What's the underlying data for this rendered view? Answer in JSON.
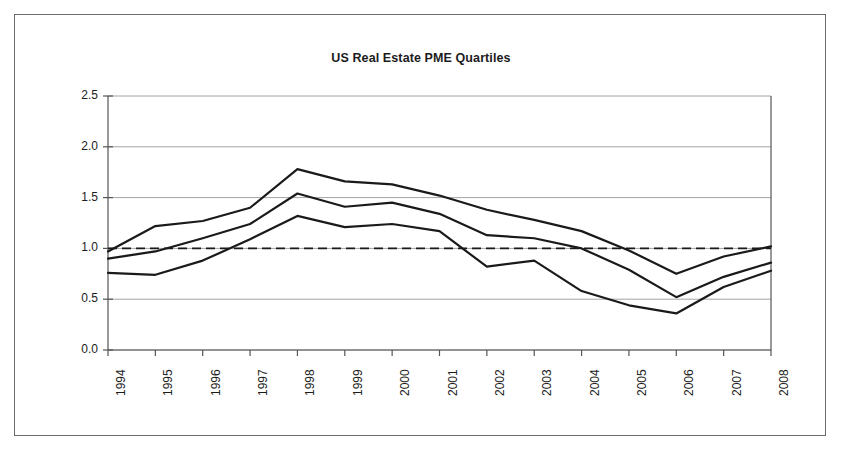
{
  "figure": {
    "title": "US Real Estate PME Quartiles",
    "has_outer_border": true,
    "border_color": "#6b6b6b",
    "background": "#ffffff"
  },
  "axes": {
    "y_ticks": [
      "0.0",
      "0.5",
      "1.0",
      "1.5",
      "2.0",
      "2.5"
    ],
    "x_ticks": [
      "1994",
      "1995",
      "1996",
      "1997",
      "1998",
      "1999",
      "2000",
      "2001",
      "2002",
      "2003",
      "2004",
      "2005",
      "2006",
      "2007",
      "2008"
    ],
    "y_label": "",
    "x_label": "",
    "x_tick_rotation_deg": 90
  },
  "chart_data": {
    "type": "line",
    "title": "US Real Estate PME Quartiles",
    "xlabel": "",
    "ylabel": "",
    "x": [
      "1994",
      "1995",
      "1996",
      "1997",
      "1998",
      "1999",
      "2000",
      "2001",
      "2002",
      "2003",
      "2004",
      "2005",
      "2006",
      "2007",
      "2008"
    ],
    "categories": [
      "1994",
      "1995",
      "1996",
      "1997",
      "1998",
      "1999",
      "2000",
      "2001",
      "2002",
      "2003",
      "2004",
      "2005",
      "2006",
      "2007",
      "2008"
    ],
    "ylim": [
      0.0,
      2.5
    ],
    "xlim": [
      "1994",
      "2008"
    ],
    "grid": true,
    "grid_axis": "y",
    "grid_color": "#9a9a9a",
    "legend": false,
    "legend_position": "none",
    "line_color": "#1a1a1a",
    "line_width": 2.2,
    "series": [
      {
        "name": "Upper quartile",
        "values": [
          0.97,
          1.22,
          1.27,
          1.4,
          1.78,
          1.66,
          1.63,
          1.52,
          1.38,
          1.28,
          1.17,
          0.98,
          0.75,
          0.92,
          1.02
        ]
      },
      {
        "name": "Median",
        "values": [
          0.9,
          0.97,
          1.1,
          1.24,
          1.54,
          1.41,
          1.45,
          1.34,
          1.13,
          1.1,
          1.0,
          0.79,
          0.52,
          0.72,
          0.86
        ]
      },
      {
        "name": "Lower quartile",
        "values": [
          0.76,
          0.74,
          0.88,
          1.09,
          1.32,
          1.21,
          1.24,
          1.17,
          0.82,
          0.88,
          0.58,
          0.44,
          0.36,
          0.62,
          0.78
        ]
      }
    ],
    "reference_line": {
      "name": "PME parity",
      "value": 1.0,
      "style": "dashed",
      "color": "#1a1a1a"
    }
  }
}
